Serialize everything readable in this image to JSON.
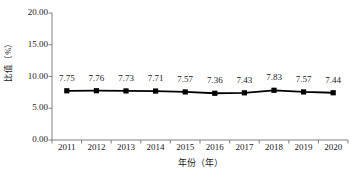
{
  "chart_data": {
    "type": "line",
    "title": "",
    "subtitle": "",
    "xlabel": "年份（年）",
    "ylabel": "比值（%）",
    "categories": [
      "2011",
      "2012",
      "2013",
      "2014",
      "2015",
      "2016",
      "2017",
      "2018",
      "2019",
      "2020"
    ],
    "values": [
      7.75,
      7.76,
      7.73,
      7.71,
      7.57,
      7.36,
      7.43,
      7.83,
      7.57,
      7.44
    ],
    "value_labels": [
      "7.75",
      "7.76",
      "7.73",
      "7.71",
      "7.57",
      "7.36",
      "7.43",
      "7.83",
      "7.57",
      "7.44"
    ],
    "series": [
      {
        "name": "比值",
        "values": [
          7.75,
          7.76,
          7.73,
          7.71,
          7.57,
          7.36,
          7.43,
          7.83,
          7.57,
          7.44
        ],
        "color": "#000000",
        "marker": "square"
      }
    ],
    "ylim": [
      0,
      20
    ],
    "ytick_values": [
      0,
      5,
      10,
      15,
      20
    ],
    "ytick_labels": [
      "0.00",
      "5.00",
      "10.00",
      "15.00",
      "20.00"
    ],
    "grid": false,
    "legend": false,
    "legend_position": "none",
    "axis_color": "#808080",
    "line_color": "#000000",
    "marker_color": "#000000",
    "background": "#ffffff"
  }
}
